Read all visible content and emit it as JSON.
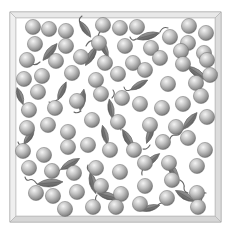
{
  "diagram": {
    "title": "",
    "colors": {
      "background": "#ffffff",
      "frame_outer": "#f4f4f4",
      "frame_edge": "#9a9a9a",
      "frame_inner_shadow": "#c8c8c8",
      "sphere_highlight": "#f2f2f2",
      "sphere_mid": "#bdbdbd",
      "sphere_edge": "#7a7a7a",
      "particle_fill": "#7d7d7d",
      "particle_edge": "#555555",
      "tail": "#666666"
    },
    "frame": {
      "outer": [
        10,
        12,
        221,
        222
      ],
      "inner": [
        16,
        18,
        215,
        216
      ]
    },
    "sphere_radius": 7.6,
    "spheres": [
      [
        33,
        27
      ],
      [
        49,
        29
      ],
      [
        66,
        31
      ],
      [
        103,
        25
      ],
      [
        120,
        28
      ],
      [
        137,
        27
      ],
      [
        189,
        26
      ],
      [
        206,
        33
      ],
      [
        170,
        37
      ],
      [
        188,
        43
      ],
      [
        35,
        44
      ],
      [
        66,
        46
      ],
      [
        99,
        43
      ],
      [
        125,
        46
      ],
      [
        151,
        48
      ],
      [
        181,
        51
      ],
      [
        204,
        53
      ],
      [
        27,
        60
      ],
      [
        56,
        61
      ],
      [
        81,
        57
      ],
      [
        105,
        63
      ],
      [
        133,
        63
      ],
      [
        160,
        58
      ],
      [
        183,
        64
      ],
      [
        207,
        60
      ],
      [
        42,
        76
      ],
      [
        24,
        79
      ],
      [
        38,
        92
      ],
      [
        72,
        73
      ],
      [
        96,
        80
      ],
      [
        118,
        74
      ],
      [
        145,
        70
      ],
      [
        168,
        84
      ],
      [
        196,
        83
      ],
      [
        210,
        75
      ],
      [
        29,
        110
      ],
      [
        55,
        108
      ],
      [
        77,
        101
      ],
      [
        101,
        94
      ],
      [
        122,
        98
      ],
      [
        140,
        104
      ],
      [
        162,
        108
      ],
      [
        183,
        104
      ],
      [
        201,
        96
      ],
      [
        27,
        128
      ],
      [
        48,
        125
      ],
      [
        68,
        132
      ],
      [
        92,
        120
      ],
      [
        118,
        122
      ],
      [
        150,
        125
      ],
      [
        176,
        127
      ],
      [
        207,
        117
      ],
      [
        23,
        151
      ],
      [
        44,
        155
      ],
      [
        68,
        147
      ],
      [
        88,
        145
      ],
      [
        110,
        150
      ],
      [
        134,
        150
      ],
      [
        163,
        142
      ],
      [
        188,
        138
      ],
      [
        205,
        150
      ],
      [
        29,
        168
      ],
      [
        52,
        171
      ],
      [
        74,
        173
      ],
      [
        96,
        168
      ],
      [
        120,
        172
      ],
      [
        145,
        163
      ],
      [
        169,
        163
      ],
      [
        197,
        166
      ],
      [
        36,
        193
      ],
      [
        53,
        196
      ],
      [
        77,
        192
      ],
      [
        101,
        186
      ],
      [
        121,
        194
      ],
      [
        145,
        186
      ],
      [
        172,
        180
      ],
      [
        197,
        193
      ],
      [
        65,
        209
      ],
      [
        93,
        207
      ],
      [
        116,
        207
      ],
      [
        140,
        204
      ],
      [
        167,
        198
      ],
      [
        198,
        207
      ]
    ],
    "particles": [
      {
        "cx": 50,
        "cy": 52,
        "len": 22,
        "w": 7,
        "angle": -50,
        "tail": "M40,62 q-4,4 -8,2 q-3,-2 -6,1"
      },
      {
        "cx": 91,
        "cy": 56,
        "len": 22,
        "w": 7,
        "angle": -60,
        "tail": "M86,46 q3,-6 7,-5"
      },
      {
        "cx": 104,
        "cy": 48,
        "len": 20,
        "w": 6,
        "angle": 65,
        "tail": "M99,40 q-2,-6 2,-9"
      },
      {
        "cx": 148,
        "cy": 36,
        "len": 24,
        "w": 7,
        "angle": -15,
        "tail": "M136,39 q-4,3 -6,-2 M160,32 q3,-6 8,-4"
      },
      {
        "cx": 197,
        "cy": 73,
        "len": 24,
        "w": 7,
        "angle": 35,
        "tail": "M207,80 q5,2 6,-4 q1,-4 4,-3"
      },
      {
        "cx": 82,
        "cy": 100,
        "len": 22,
        "w": 7,
        "angle": -80,
        "tail": "M81,111 q-4,3 -7,1"
      },
      {
        "cx": 62,
        "cy": 91,
        "len": 20,
        "w": 6,
        "angle": -65,
        "tail": "M57,100 q-4,4 -8,2"
      },
      {
        "cx": 20,
        "cy": 96,
        "len": 18,
        "w": 6,
        "angle": 70,
        "tail": "M24,104 q2,4 -2,6"
      },
      {
        "cx": 111,
        "cy": 109,
        "len": 20,
        "w": 6,
        "angle": 80,
        "tail": "M112,98 q4,-4 1,-8"
      },
      {
        "cx": 139,
        "cy": 85,
        "len": 20,
        "w": 6,
        "angle": -30,
        "tail": "M130,90 q-5,2 -6,-3"
      },
      {
        "cx": 190,
        "cy": 121,
        "len": 22,
        "w": 7,
        "angle": -50,
        "tail": "M182,130 q-2,6 -7,5 q-4,0 -5,4"
      },
      {
        "cx": 70,
        "cy": 164,
        "len": 22,
        "w": 7,
        "angle": -30,
        "tail": "M60,170 q-3,4 -6,2"
      },
      {
        "cx": 105,
        "cy": 135,
        "len": 20,
        "w": 6,
        "angle": 75,
        "tail": "M107,146 q3,4 0,8"
      },
      {
        "cx": 128,
        "cy": 139,
        "len": 22,
        "w": 7,
        "angle": 60,
        "tail": "M121,130 q-2,-6 2,-9"
      },
      {
        "cx": 152,
        "cy": 160,
        "len": 20,
        "w": 6,
        "angle": -40,
        "tail": "M145,167 q-4,3 -3,8"
      },
      {
        "cx": 150,
        "cy": 134,
        "len": 20,
        "w": 6,
        "angle": -70,
        "tail": "M150,145 q-3,5 -7,4"
      },
      {
        "cx": 173,
        "cy": 171,
        "len": 22,
        "w": 7,
        "angle": 60,
        "tail": "M180,180 q5,3 4,8 q0,4 4,5"
      },
      {
        "cx": 50,
        "cy": 183,
        "len": 26,
        "w": 8,
        "angle": -5,
        "tail": "M37,184 q-4,-6 -8,-4 q-3,1 -4,-3"
      },
      {
        "cx": 93,
        "cy": 183,
        "len": 22,
        "w": 7,
        "angle": 75,
        "tail": "M90,172 q-4,-3 -2,-7"
      },
      {
        "cx": 108,
        "cy": 196,
        "len": 22,
        "w": 7,
        "angle": 15,
        "tail": "M97,195 q-3,4 0,8"
      },
      {
        "cx": 185,
        "cy": 196,
        "len": 22,
        "w": 7,
        "angle": 30,
        "tail": "M196,202 q6,1 6,-5 q0,-5 4,-4"
      },
      {
        "cx": 150,
        "cy": 208,
        "len": 20,
        "w": 6,
        "angle": -15,
        "tail": "M158,205 q4,-4 7,0"
      },
      {
        "cx": 85,
        "cy": 29,
        "len": 20,
        "w": 6,
        "angle": 55,
        "tail": "M80,22 q-2,-3 2,-6"
      },
      {
        "cx": 29,
        "cy": 137,
        "len": 18,
        "w": 6,
        "angle": -55,
        "tail": "M23,144 q-4,2 -5,-2"
      }
    ]
  }
}
